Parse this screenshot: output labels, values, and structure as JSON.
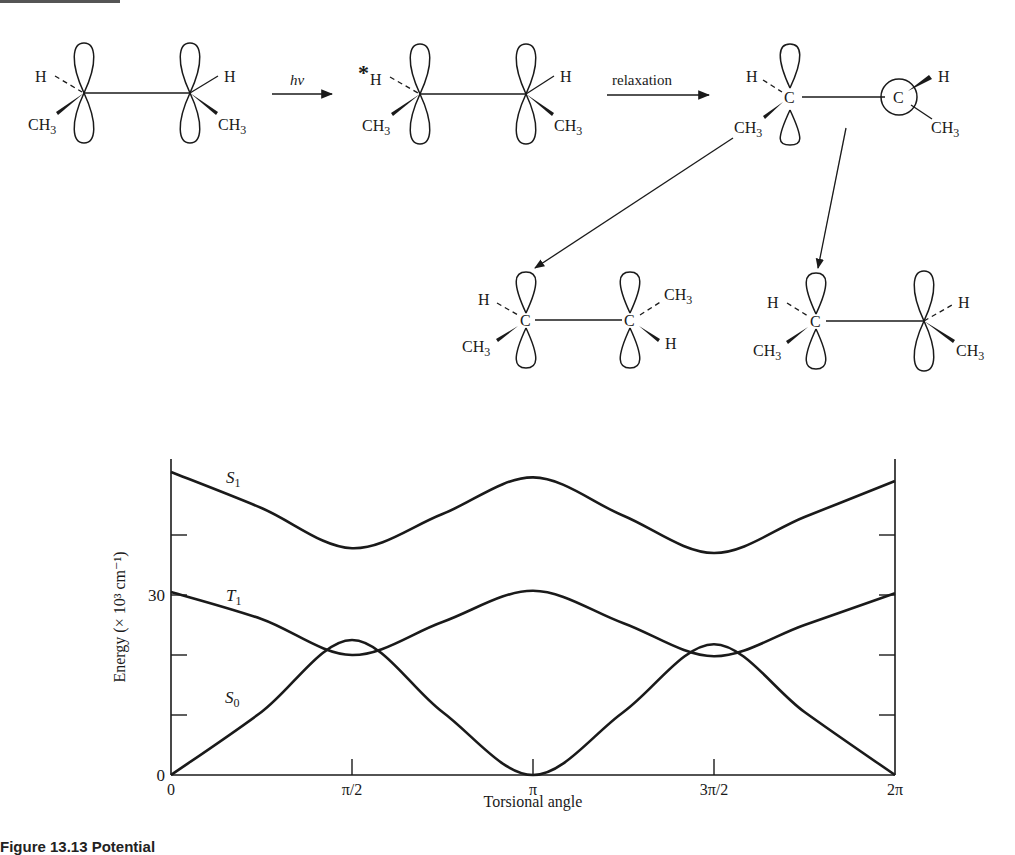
{
  "header_rule": true,
  "reaction": {
    "reactant": {
      "left_labels": [
        "H",
        "CH3"
      ],
      "right_labels": [
        "H",
        "CH3"
      ]
    },
    "arrow1_label": "hν",
    "excited": {
      "star": "*",
      "left_labels": [
        "H",
        "CH3"
      ],
      "right_labels": [
        "H",
        "CH3"
      ]
    },
    "arrow2_label": "relaxation",
    "twisted": {
      "left_labels": [
        "H",
        "C",
        "CH3"
      ],
      "right_labels": [
        "C",
        "H",
        "CH3"
      ]
    },
    "product_cis": {
      "left_labels": [
        "H",
        "C",
        "CH3"
      ],
      "right_labels": [
        "C",
        "CH3",
        "H"
      ]
    },
    "product_trans": {
      "left_labels": [
        "H",
        "C",
        "CH3"
      ],
      "right_labels": [
        "H",
        "CH3"
      ]
    }
  },
  "chart_data": {
    "type": "line",
    "title": "",
    "xlabel": "Torsional angle",
    "ylabel": "Energy (× 10³ cm⁻¹)",
    "x_ticks": [
      "0",
      "π/2",
      "π",
      "3π/2",
      "2π"
    ],
    "y_tick_labels": [
      {
        "value": 0,
        "label": "0"
      },
      {
        "value": 30,
        "label": "30"
      }
    ],
    "y_ticks_unlabeled": [
      10,
      20,
      40
    ],
    "ylim": [
      0,
      52
    ],
    "grid": false,
    "x": [
      0,
      0.785,
      1.571,
      2.356,
      3.142,
      3.927,
      4.712,
      5.498,
      6.283
    ],
    "series": [
      {
        "name": "S1",
        "label": "S",
        "sub": "1",
        "values": [
          50.5,
          44.5,
          37.8,
          43.5,
          49.6,
          43.2,
          37.0,
          43.0,
          49.0
        ]
      },
      {
        "name": "T1",
        "label": "T",
        "sub": "1",
        "values": [
          30.5,
          26.0,
          20.0,
          25.5,
          30.7,
          25.3,
          19.8,
          25.0,
          30.3
        ]
      },
      {
        "name": "S0",
        "label": "S",
        "sub": "0",
        "values": [
          0,
          10.5,
          22.5,
          10.5,
          0,
          10.5,
          21.8,
          10.5,
          0
        ]
      }
    ]
  },
  "caption": "Figure 13.13 Potential"
}
